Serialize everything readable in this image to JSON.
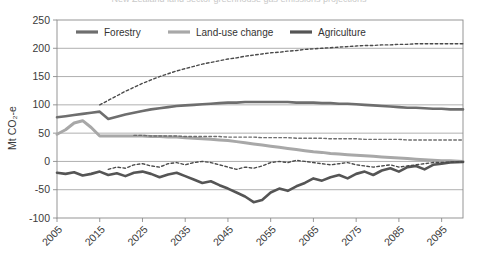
{
  "title_clipped": "New Zealand land sector greenhouse gas emissions projections",
  "axes": {
    "ylabel": "Mt CO₂-e",
    "yticks": [
      250,
      200,
      150,
      100,
      50,
      0,
      -50,
      -100
    ],
    "ylim": [
      -100,
      250
    ],
    "xticks": [
      2005,
      2015,
      2025,
      2035,
      2045,
      2055,
      2065,
      2075,
      2085,
      2095
    ],
    "xlim": [
      2005,
      2100
    ],
    "grid": "horizontal"
  },
  "legend": {
    "position": "top-inside",
    "entries": [
      {
        "label": "Forestry",
        "color": "#6e6e6e"
      },
      {
        "label": "Land-use change",
        "color": "#a8a8a8"
      },
      {
        "label": "Agriculture",
        "color": "#555555"
      }
    ]
  },
  "colors": {
    "forestry": "#6e6e6e",
    "land_use_change": "#a8a8a8",
    "agriculture": "#555555",
    "dashed_dark": "#4a4a4a",
    "grid": "#8c8c8c",
    "frame": "#8a8a8a",
    "text": "#3a3a3a"
  },
  "chart_data": {
    "type": "line",
    "title": "New Zealand land sector greenhouse gas emissions projections",
    "xlabel": "",
    "ylabel": "Mt CO₂-e",
    "xlim": [
      2005,
      2100
    ],
    "ylim": [
      -100,
      250
    ],
    "grid": true,
    "legend_position": "top-inside",
    "x": [
      2005,
      2007,
      2009,
      2011,
      2013,
      2015,
      2017,
      2019,
      2021,
      2023,
      2025,
      2027,
      2029,
      2031,
      2033,
      2035,
      2037,
      2039,
      2041,
      2043,
      2045,
      2047,
      2049,
      2051,
      2053,
      2055,
      2057,
      2059,
      2061,
      2063,
      2065,
      2067,
      2069,
      2071,
      2073,
      2075,
      2077,
      2079,
      2081,
      2083,
      2085,
      2087,
      2089,
      2091,
      2093,
      2095,
      2097,
      2100
    ],
    "series": [
      {
        "name": "Forestry",
        "style": "solid",
        "color": "#6e6e6e",
        "values": [
          78,
          80,
          82,
          84,
          86,
          88,
          75,
          79,
          83,
          86,
          89,
          92,
          94,
          96,
          98,
          99,
          100,
          101,
          102,
          103,
          104,
          104,
          105,
          105,
          105,
          105,
          105,
          105,
          104,
          104,
          104,
          103,
          103,
          102,
          102,
          101,
          100,
          99,
          98,
          97,
          96,
          95,
          95,
          94,
          93,
          93,
          92,
          92
        ]
      },
      {
        "name": "Land-use change",
        "style": "solid",
        "color": "#a8a8a8",
        "values": [
          48,
          56,
          68,
          72,
          60,
          45,
          45,
          45,
          45,
          45,
          45,
          44,
          44,
          43,
          43,
          42,
          41,
          40,
          39,
          38,
          37,
          35,
          33,
          31,
          29,
          27,
          25,
          23,
          21,
          19,
          17,
          16,
          14,
          13,
          12,
          11,
          10,
          9,
          8,
          7,
          6,
          5,
          4,
          3,
          2,
          1,
          1,
          0
        ]
      },
      {
        "name": "Agriculture",
        "style": "solid",
        "color": "#555555",
        "values": [
          -20,
          -22,
          -19,
          -25,
          -22,
          -18,
          -24,
          -21,
          -26,
          -20,
          -18,
          -22,
          -28,
          -23,
          -20,
          -26,
          -32,
          -38,
          -35,
          -42,
          -48,
          -55,
          -62,
          -72,
          -68,
          -55,
          -48,
          -52,
          -44,
          -38,
          -30,
          -34,
          -28,
          -24,
          -30,
          -22,
          -18,
          -24,
          -16,
          -12,
          -18,
          -10,
          -8,
          -14,
          -6,
          -4,
          -2,
          -1
        ]
      },
      {
        "name": "Total (projected)",
        "style": "dashed",
        "color": "#4a4a4a",
        "values": [
          null,
          null,
          null,
          null,
          null,
          100,
          108,
          116,
          124,
          131,
          138,
          144,
          150,
          155,
          160,
          164,
          168,
          172,
          175,
          178,
          181,
          183,
          186,
          188,
          190,
          192,
          193,
          195,
          196,
          198,
          199,
          200,
          201,
          202,
          203,
          204,
          205,
          205,
          206,
          206,
          207,
          207,
          208,
          208,
          208,
          208,
          208,
          208
        ]
      },
      {
        "name": "Land-use change (reference)",
        "style": "dashed",
        "color": "#6e6e6e",
        "values": [
          null,
          null,
          null,
          null,
          null,
          null,
          null,
          null,
          null,
          46,
          46,
          45,
          45,
          45,
          45,
          44,
          44,
          44,
          44,
          44,
          43,
          43,
          43,
          43,
          42,
          42,
          42,
          42,
          41,
          41,
          41,
          41,
          40,
          40,
          40,
          40,
          39,
          39,
          39,
          39,
          39,
          38,
          38,
          38,
          38,
          38,
          38,
          38
        ]
      },
      {
        "name": "Agriculture (reference)",
        "style": "dashed",
        "color": "#4a4a4a",
        "values": [
          null,
          null,
          null,
          null,
          null,
          null,
          -14,
          -10,
          -12,
          -6,
          -4,
          -8,
          -10,
          -4,
          -2,
          -6,
          -2,
          0,
          -2,
          -6,
          -10,
          -14,
          -10,
          -12,
          -8,
          -2,
          0,
          -2,
          2,
          0,
          -2,
          -4,
          -6,
          -4,
          -2,
          -6,
          -8,
          -10,
          -8,
          -6,
          -10,
          -8,
          -6,
          -4,
          -2,
          -2,
          -1,
          -1
        ]
      }
    ]
  }
}
